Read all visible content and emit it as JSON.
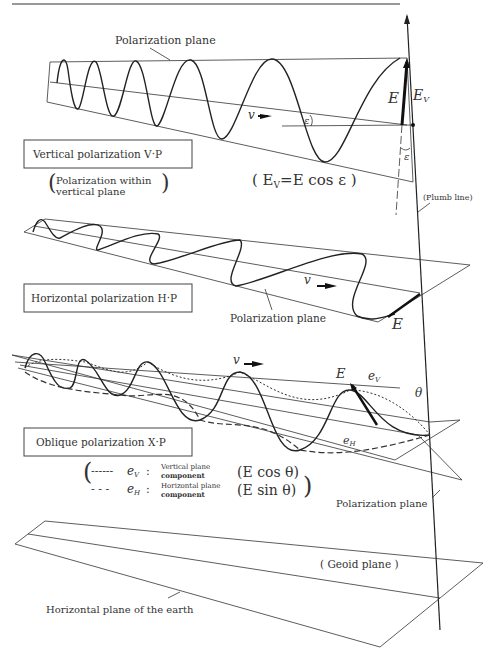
{
  "header": {
    "rule": true
  },
  "vertical": {
    "title": "Vertical polarization  V·P",
    "sub1": "Polarization within",
    "sub2": "vertical plane",
    "plane_label": "Polarization plane",
    "formula": "(E_V = E cos ε)",
    "formula_text": "( E",
    "formula_sub": "V",
    "formula_rest": "=E cos ε )",
    "v_label": "v",
    "eps": "ε",
    "E": "E",
    "Ev": "E",
    "Ev_sub": "V",
    "plumb": "(Plumb line)"
  },
  "horizontal": {
    "title": "Horizontal polarization  H·P",
    "plane_label": "Polarization plane",
    "v_label": "v",
    "E": "E"
  },
  "oblique": {
    "title": "Oblique polarization   X·P",
    "v_label": "v",
    "E": "E",
    "ev": "e",
    "ev_sub": "V",
    "eh": "e",
    "eh_sub": "H",
    "theta": "θ",
    "legend": [
      {
        "line": "------",
        "sym": "e",
        "sub": "V",
        "desc1": "Vertical plane",
        "desc2": "component",
        "formula": "(E cos θ)"
      },
      {
        "line": "- - -",
        "sym": "e",
        "sub": "H",
        "desc1": "Horizontal plane",
        "desc2": "component",
        "formula": "(E sin θ)"
      }
    ],
    "plane_label": "Polarization plane"
  },
  "earth": {
    "geoid": "( Geoid plane )",
    "horizontal_plane": "Horizontal plane of the earth"
  }
}
